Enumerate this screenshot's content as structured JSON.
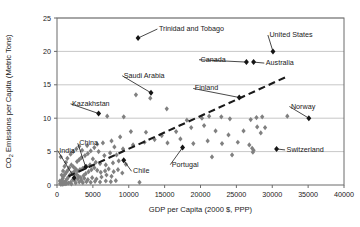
{
  "chart_data": {
    "type": "scatter",
    "title": "",
    "xlabel": "GDP per Capita (2000 $, PPP)",
    "ylabel": "CO2 Emissions per Capita (Metric Tons)",
    "ylabel_parts": {
      "pre": "CO",
      "sub": "2",
      "post": " Emissions per Capita (Metric Tons)"
    },
    "xlim": [
      0,
      40000
    ],
    "ylim": [
      0,
      25
    ],
    "xticks": [
      0,
      5000,
      10000,
      15000,
      20000,
      25000,
      30000,
      35000,
      40000
    ],
    "xticklabels": [
      "0",
      "5000",
      "10000",
      "15000",
      "20000",
      "25000",
      "30000",
      "35000",
      "40000"
    ],
    "yticks": [
      0,
      5,
      10,
      15,
      20,
      25
    ],
    "yticklabels": [
      "0",
      "5",
      "10",
      "15",
      "20",
      "25"
    ],
    "grid": "horizontal",
    "legend": "none",
    "marker": "diamond",
    "colors": {
      "point_unlabeled": "#808080",
      "point_labeled": "#141414",
      "gridline": "#b9b9b9",
      "axis": "#6b6b6b",
      "trendline": "#1a1a1a",
      "text": "#1a1a1a",
      "background": "#ffffff"
    },
    "trendline": {
      "type": "linear-dashed",
      "x_start": 1600,
      "y_start": 1.3,
      "x_end": 32200,
      "y_end": 16.3
    },
    "labeled_points": [
      {
        "name": "Trinidad and Tobago",
        "x": 11300,
        "y": 22.0,
        "label_x": 14200,
        "label_y": 23.5,
        "anchor": "start"
      },
      {
        "name": "United States",
        "x": 30100,
        "y": 20.0,
        "label_x": 29600,
        "label_y": 22.6,
        "anchor": "start"
      },
      {
        "name": "Canada",
        "x": 26400,
        "y": 18.4,
        "label_x": 20000,
        "label_y": 18.9,
        "anchor": "start"
      },
      {
        "name": "Australia",
        "x": 27400,
        "y": 18.4,
        "label_x": 29100,
        "label_y": 18.4,
        "anchor": "start"
      },
      {
        "name": "Saudi Arabia",
        "x": 13100,
        "y": 13.8,
        "label_x": 9300,
        "label_y": 16.5,
        "anchor": "start"
      },
      {
        "name": "Finland",
        "x": 25400,
        "y": 13.1,
        "label_x": 19200,
        "label_y": 14.6,
        "anchor": "start"
      },
      {
        "name": "Kazakhstan",
        "x": 5800,
        "y": 10.7,
        "label_x": 2100,
        "label_y": 12.3,
        "anchor": "start"
      },
      {
        "name": "Norway",
        "x": 35100,
        "y": 10.0,
        "label_x": 32600,
        "label_y": 11.9,
        "anchor": "start"
      },
      {
        "name": "Switzerland",
        "x": 30600,
        "y": 5.4,
        "label_x": 32000,
        "label_y": 5.4,
        "anchor": "start"
      },
      {
        "name": "Portugal",
        "x": 17500,
        "y": 5.6,
        "label_x": 16000,
        "label_y": 3.2,
        "anchor": "start"
      },
      {
        "name": "Chile",
        "x": 9300,
        "y": 3.7,
        "label_x": 10600,
        "label_y": 2.2,
        "anchor": "start"
      },
      {
        "name": "China",
        "x": 4000,
        "y": 2.7,
        "label_x": 3100,
        "label_y": 6.4,
        "anchor": "start"
      },
      {
        "name": "India",
        "x": 2400,
        "y": 1.1,
        "label_x": 300,
        "label_y": 5.3,
        "anchor": "start"
      }
    ],
    "unlabeled_points": [
      {
        "x": 11000,
        "y": 13.5
      },
      {
        "x": 13000,
        "y": 13.0
      },
      {
        "x": 7000,
        "y": 10.3
      },
      {
        "x": 9300,
        "y": 10.2
      },
      {
        "x": 15300,
        "y": 11.4
      },
      {
        "x": 18100,
        "y": 9.7
      },
      {
        "x": 20200,
        "y": 10.0
      },
      {
        "x": 21200,
        "y": 10.3
      },
      {
        "x": 22900,
        "y": 10.2
      },
      {
        "x": 24100,
        "y": 9.9
      },
      {
        "x": 27000,
        "y": 9.8
      },
      {
        "x": 27800,
        "y": 10.1
      },
      {
        "x": 28600,
        "y": 10.2
      },
      {
        "x": 32100,
        "y": 10.3
      },
      {
        "x": 18700,
        "y": 8.6
      },
      {
        "x": 20500,
        "y": 8.9
      },
      {
        "x": 22100,
        "y": 8.1
      },
      {
        "x": 23900,
        "y": 7.5
      },
      {
        "x": 26000,
        "y": 8.1
      },
      {
        "x": 27900,
        "y": 8.7
      },
      {
        "x": 28400,
        "y": 7.8
      },
      {
        "x": 29000,
        "y": 8.6
      },
      {
        "x": 16600,
        "y": 8.0
      },
      {
        "x": 14600,
        "y": 7.4
      },
      {
        "x": 12400,
        "y": 7.9
      },
      {
        "x": 10300,
        "y": 8.0
      },
      {
        "x": 8800,
        "y": 7.2
      },
      {
        "x": 7600,
        "y": 6.6
      },
      {
        "x": 6400,
        "y": 6.3
      },
      {
        "x": 5600,
        "y": 6.1
      },
      {
        "x": 8000,
        "y": 5.7
      },
      {
        "x": 9200,
        "y": 5.4
      },
      {
        "x": 10600,
        "y": 6.0
      },
      {
        "x": 12200,
        "y": 6.4
      },
      {
        "x": 13600,
        "y": 6.8
      },
      {
        "x": 15400,
        "y": 6.3
      },
      {
        "x": 17200,
        "y": 6.9
      },
      {
        "x": 19000,
        "y": 6.2
      },
      {
        "x": 21000,
        "y": 6.6
      },
      {
        "x": 23000,
        "y": 6.2
      },
      {
        "x": 25200,
        "y": 6.4
      },
      {
        "x": 26800,
        "y": 6.0
      },
      {
        "x": 27200,
        "y": 5.5
      },
      {
        "x": 27400,
        "y": 5.2
      },
      {
        "x": 27300,
        "y": 4.9
      },
      {
        "x": 24400,
        "y": 4.5
      },
      {
        "x": 21600,
        "y": 4.2
      },
      {
        "x": 11500,
        "y": 0.4
      },
      {
        "x": 6600,
        "y": 4.4
      },
      {
        "x": 7400,
        "y": 4.8
      },
      {
        "x": 8300,
        "y": 4.5
      },
      {
        "x": 5200,
        "y": 5.6
      },
      {
        "x": 4700,
        "y": 5.1
      },
      {
        "x": 4300,
        "y": 4.7
      },
      {
        "x": 3900,
        "y": 4.4
      },
      {
        "x": 3400,
        "y": 4.1
      },
      {
        "x": 3100,
        "y": 3.8
      },
      {
        "x": 2800,
        "y": 3.5
      },
      {
        "x": 5000,
        "y": 3.9
      },
      {
        "x": 5400,
        "y": 3.4
      },
      {
        "x": 6000,
        "y": 3.2
      },
      {
        "x": 6800,
        "y": 3.0
      },
      {
        "x": 7800,
        "y": 3.3
      },
      {
        "x": 8600,
        "y": 3.6
      },
      {
        "x": 9600,
        "y": 3.1
      },
      {
        "x": 4600,
        "y": 3.0
      },
      {
        "x": 4100,
        "y": 2.8
      },
      {
        "x": 3600,
        "y": 2.5
      },
      {
        "x": 3200,
        "y": 2.3
      },
      {
        "x": 2900,
        "y": 2.1
      },
      {
        "x": 2600,
        "y": 2.4
      },
      {
        "x": 2300,
        "y": 2.7
      },
      {
        "x": 2000,
        "y": 3.0
      },
      {
        "x": 1700,
        "y": 2.6
      },
      {
        "x": 1500,
        "y": 2.2
      },
      {
        "x": 1300,
        "y": 1.9
      },
      {
        "x": 1100,
        "y": 1.6
      },
      {
        "x": 900,
        "y": 1.3
      },
      {
        "x": 800,
        "y": 1.0
      },
      {
        "x": 700,
        "y": 0.7
      },
      {
        "x": 600,
        "y": 0.5
      },
      {
        "x": 500,
        "y": 0.3
      },
      {
        "x": 450,
        "y": 0.2
      },
      {
        "x": 1000,
        "y": 0.4
      },
      {
        "x": 1200,
        "y": 0.6
      },
      {
        "x": 1400,
        "y": 0.9
      },
      {
        "x": 1600,
        "y": 1.2
      },
      {
        "x": 1800,
        "y": 1.5
      },
      {
        "x": 2100,
        "y": 1.8
      },
      {
        "x": 2400,
        "y": 2.0
      },
      {
        "x": 2700,
        "y": 1.6
      },
      {
        "x": 3000,
        "y": 1.3
      },
      {
        "x": 3300,
        "y": 1.1
      },
      {
        "x": 3700,
        "y": 1.4
      },
      {
        "x": 4000,
        "y": 1.7
      },
      {
        "x": 4400,
        "y": 2.0
      },
      {
        "x": 4800,
        "y": 2.3
      },
      {
        "x": 5200,
        "y": 2.6
      },
      {
        "x": 5600,
        "y": 2.2
      },
      {
        "x": 6100,
        "y": 1.9
      },
      {
        "x": 6700,
        "y": 2.1
      },
      {
        "x": 7200,
        "y": 2.4
      },
      {
        "x": 7900,
        "y": 2.0
      },
      {
        "x": 8500,
        "y": 2.3
      },
      {
        "x": 9100,
        "y": 1.8
      },
      {
        "x": 2200,
        "y": 0.8
      },
      {
        "x": 2500,
        "y": 0.6
      },
      {
        "x": 2900,
        "y": 0.9
      },
      {
        "x": 3400,
        "y": 0.7
      },
      {
        "x": 3800,
        "y": 1.0
      },
      {
        "x": 4300,
        "y": 0.8
      },
      {
        "x": 4900,
        "y": 1.1
      },
      {
        "x": 5500,
        "y": 0.9
      },
      {
        "x": 6200,
        "y": 1.2
      },
      {
        "x": 6900,
        "y": 1.5
      },
      {
        "x": 7600,
        "y": 1.3
      },
      {
        "x": 1900,
        "y": 0.4
      },
      {
        "x": 1600,
        "y": 0.3
      },
      {
        "x": 1350,
        "y": 0.25
      },
      {
        "x": 1150,
        "y": 0.2
      },
      {
        "x": 950,
        "y": 0.15
      },
      {
        "x": 750,
        "y": 0.12
      },
      {
        "x": 550,
        "y": 0.1
      },
      {
        "x": 400,
        "y": 0.6
      },
      {
        "x": 650,
        "y": 1.5
      },
      {
        "x": 850,
        "y": 2.1
      },
      {
        "x": 1050,
        "y": 2.8
      },
      {
        "x": 1250,
        "y": 3.4
      },
      {
        "x": 520,
        "y": 4.2
      },
      {
        "x": 1450,
        "y": 4.0
      },
      {
        "x": 1900,
        "y": 4.6
      },
      {
        "x": 2250,
        "y": 5.0
      },
      {
        "x": 2700,
        "y": 5.4
      },
      {
        "x": 3100,
        "y": 5.8
      },
      {
        "x": 3500,
        "y": 5.2
      },
      {
        "x": 4200,
        "y": 5.9
      },
      {
        "x": 5800,
        "y": 5.0
      },
      {
        "x": 2000,
        "y": 0.15
      },
      {
        "x": 2600,
        "y": 0.3
      },
      {
        "x": 3100,
        "y": 0.45
      },
      {
        "x": 3600,
        "y": 0.35
      },
      {
        "x": 4100,
        "y": 0.5
      },
      {
        "x": 4700,
        "y": 0.4
      },
      {
        "x": 5300,
        "y": 0.55
      },
      {
        "x": 6000,
        "y": 0.45
      },
      {
        "x": 6800,
        "y": 0.6
      },
      {
        "x": 7500,
        "y": 0.5
      },
      {
        "x": 8200,
        "y": 0.65
      }
    ]
  }
}
